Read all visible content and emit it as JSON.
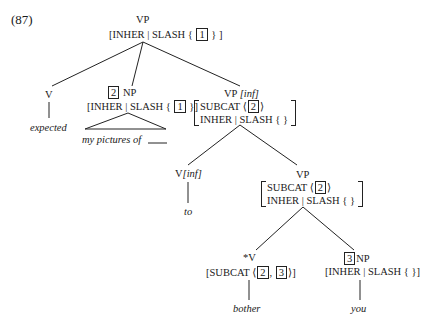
{
  "example_number": "(87)",
  "nodes": {
    "root": {
      "cat": "VP",
      "feat_prefix": "[INHER | SLASH  {",
      "tag": "1",
      "feat_suffix": "} ]"
    },
    "v_expected": {
      "cat": "V",
      "word": "expected"
    },
    "np_obj": {
      "tag": "2",
      "cat": "NP",
      "feat_prefix": "[INHER | SLASH  {",
      "inner_tag": "1",
      "feat_suffix": "}]",
      "words": "my pictures of",
      "gap": "____"
    },
    "vp_inf": {
      "cat": "VP",
      "cat_feat": "[inf]",
      "subcat_label": "SUBCAT",
      "subcat_open": "⟨",
      "subcat_tag": "2",
      "subcat_close": "⟩",
      "slash_label": "INHER | SLASH  {   }"
    },
    "v_inf": {
      "cat": "V",
      "cat_feat": "[inf]",
      "word": "to"
    },
    "vp_lower": {
      "cat": "VP",
      "subcat_label": "SUBCAT",
      "subcat_open": "⟨",
      "subcat_tag": "2",
      "subcat_close": "⟩",
      "slash_label": "INHER | SLASH  {   }"
    },
    "v_bother": {
      "cat": "*V",
      "feat_prefix": "[SUBCAT ⟨",
      "tag1": "2",
      "sep": ",",
      "tag2": "3",
      "feat_suffix": "⟩]",
      "word": "bother"
    },
    "np_you": {
      "tag": "3",
      "cat": "NP",
      "feat": "[INHER | SLASH  {    }]",
      "word": "you"
    }
  }
}
